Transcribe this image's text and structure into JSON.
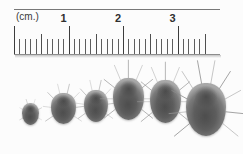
{
  "image": {
    "subject": "six house dust mite specimens arranged by increasing body size beneath a centimetre ruler",
    "medium": "black-and-white photographic scan",
    "background_color": "#fcfcfc"
  },
  "ruler": {
    "name": "centimetre-ruler",
    "unit_label": "(cm.)",
    "unit_label_position_cm": 0.08,
    "major_labels": [
      "1",
      "2",
      "3"
    ],
    "major_label_positions_cm": [
      1,
      2,
      3
    ],
    "range_cm": [
      0,
      3.55
    ],
    "minor_tick_interval_cm": 0.1,
    "half_tick_interval_cm": 0.5,
    "tick_color": "#4a4a4a",
    "edge_color": "#6e6e6e",
    "label_color": "#2f2f2f",
    "pixels_per_cm": 54.5
  },
  "specimens": {
    "count": 6,
    "order": "smallest to largest, left to right",
    "items": [
      {
        "label": "mite-1",
        "left": 22,
        "top": 43,
        "width": 17,
        "height": 22,
        "legs": 6,
        "leg_length": 0.35,
        "tone": "#6a6a6a"
      },
      {
        "label": "mite-2",
        "left": 51,
        "top": 33,
        "width": 25,
        "height": 31,
        "legs": 8,
        "leg_length": 0.55,
        "tone": "#636363"
      },
      {
        "label": "mite-3",
        "left": 84,
        "top": 30,
        "width": 24,
        "height": 32,
        "legs": 8,
        "leg_length": 0.55,
        "tone": "#686868"
      },
      {
        "label": "mite-4",
        "left": 113,
        "top": 18,
        "width": 31,
        "height": 42,
        "legs": 9,
        "leg_length": 0.7,
        "tone": "#585858"
      },
      {
        "label": "mite-5",
        "left": 150,
        "top": 20,
        "width": 31,
        "height": 43,
        "legs": 9,
        "leg_length": 0.7,
        "tone": "#555555"
      },
      {
        "label": "mite-6",
        "left": 186,
        "top": 23,
        "width": 40,
        "height": 53,
        "legs": 10,
        "leg_length": 0.75,
        "tone": "#4e4e4e"
      }
    ]
  }
}
